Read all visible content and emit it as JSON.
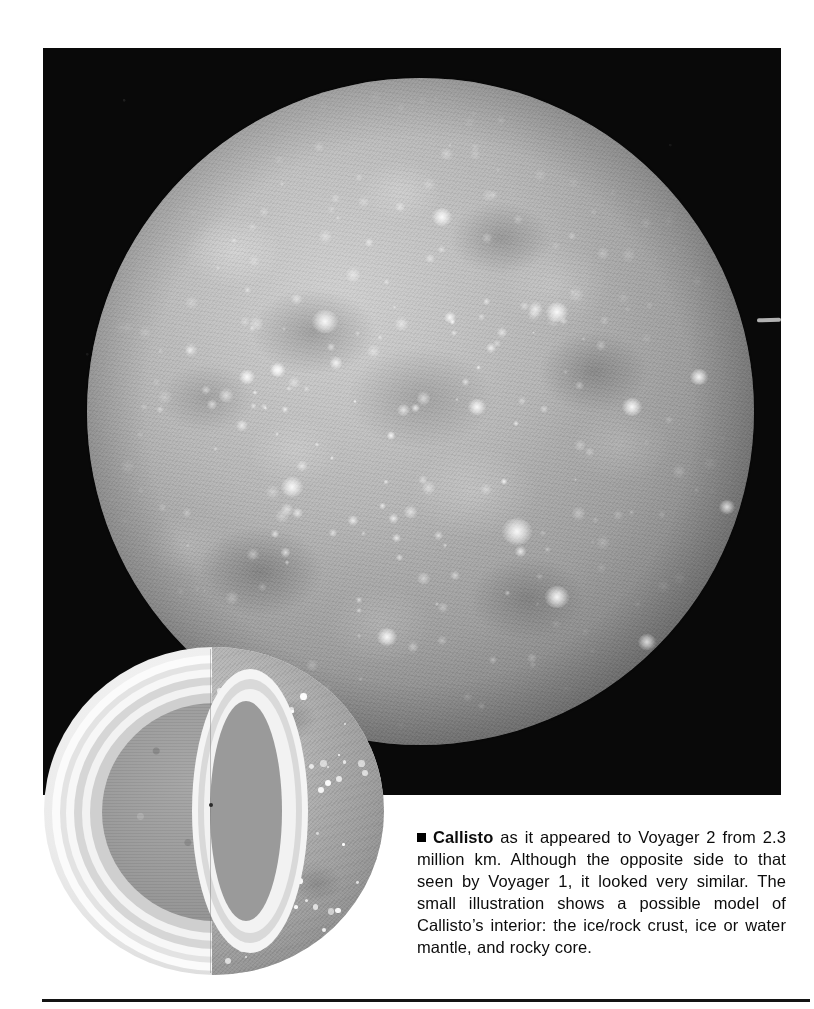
{
  "figure": {
    "kind": "photograph-with-inset-diagram",
    "subject": "Callisto",
    "main_photo": {
      "name": "callisto-voyager2-photo",
      "background_color": "#090909",
      "disc_color": "#b6b6b6",
      "description_alt": "Voyager 2 grayscale photograph of Callisto's heavily cratered icy surface against black space"
    },
    "inset": {
      "name": "callisto-interior-cutaway",
      "description_alt": "Cutaway model sphere of Callisto showing concentric interior layers",
      "layers": [
        {
          "label": "ice/rock crust",
          "color": "#f4f4f4"
        },
        {
          "label": "ice or water mantle",
          "color": "#d6d6d6"
        },
        {
          "label": "rocky core",
          "color": "#9b9b9b"
        }
      ]
    }
  },
  "caption": {
    "bullet": "black-square-bullet",
    "lead": "Callisto",
    "body": " as it appeared to Voyager 2 from 2.3 million km. Although the opposite side to that seen by Voyager 1, it looked very similar. The small illustration shows a possible model of Callisto’s interior: the ice/rock crust, ice or water mantle, and rocky core.",
    "full_text": "■ Callisto as it appeared to Voyager 2 from 2.3 million km. Although the opposite side to that seen by Voyager 1, it looked very similar. The small illustration shows a possible model of Callisto’s interior: the ice/rock crust, ice or water mantle, and rocky core."
  },
  "colors": {
    "page_background": "#ffffff",
    "plate_black": "#090909",
    "text": "#0c0c0c",
    "rule": "#141414"
  }
}
